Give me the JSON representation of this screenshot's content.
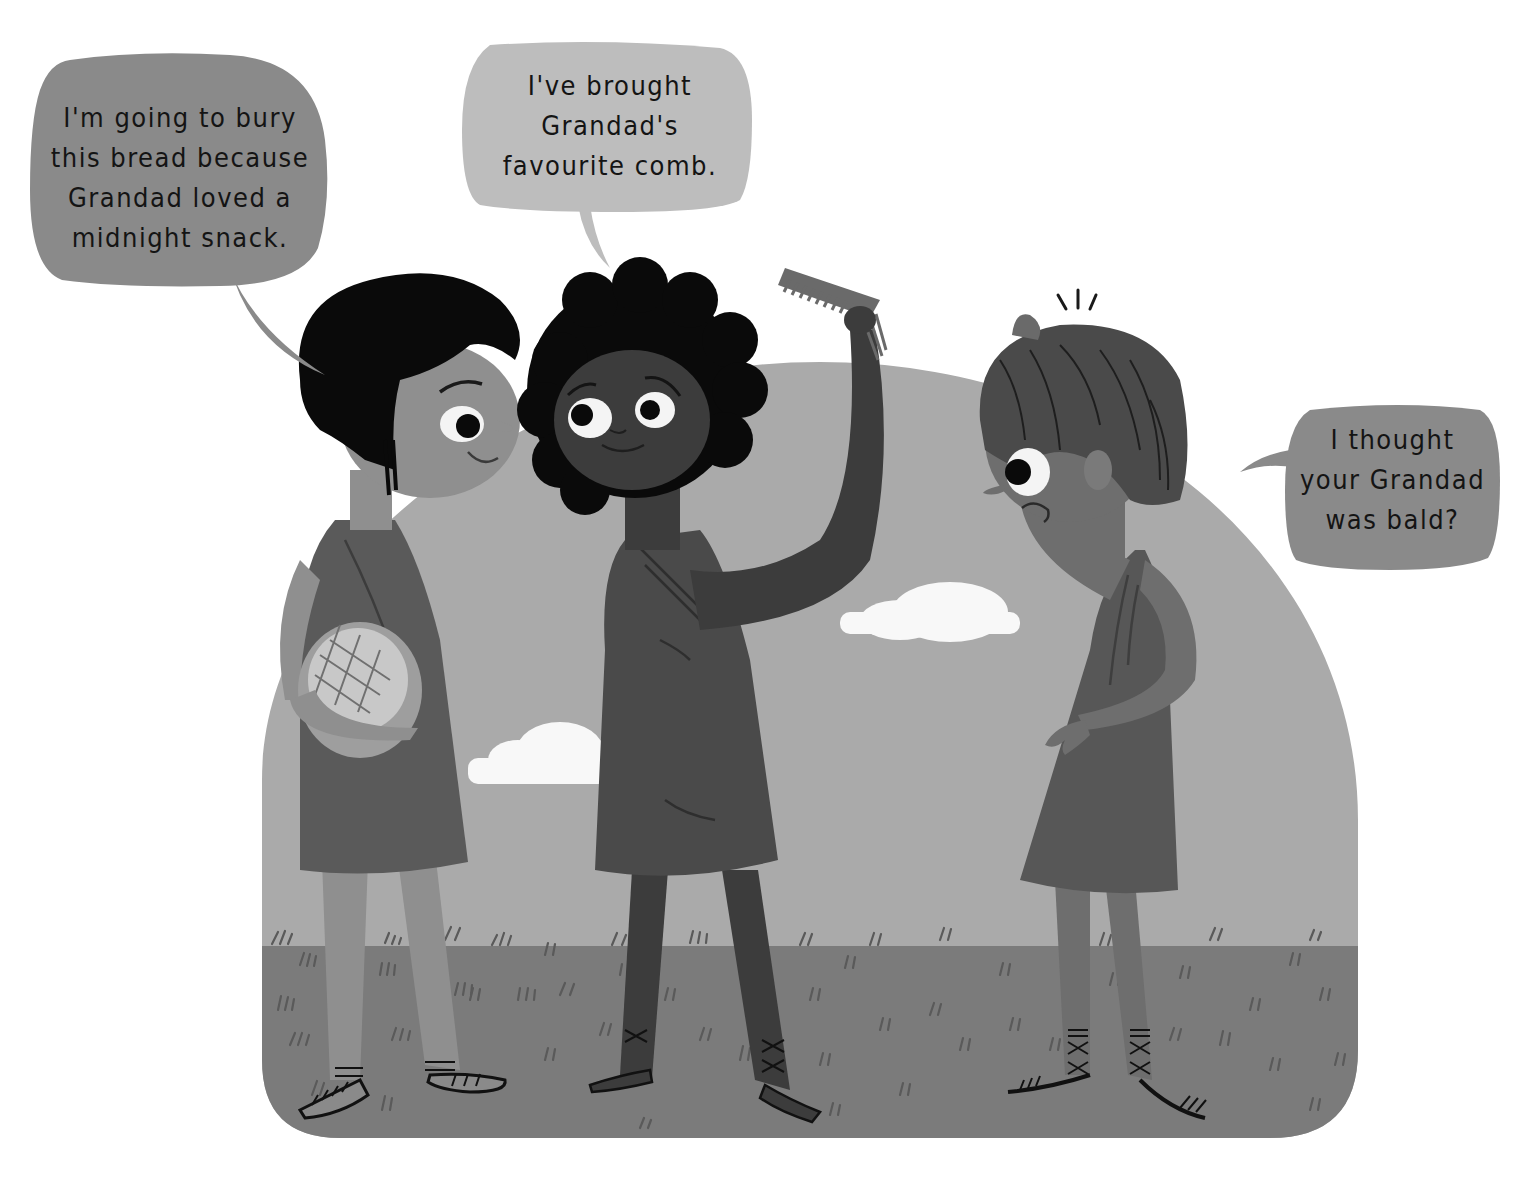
{
  "illustration": {
    "style": "grayscale children's book illustration",
    "colors": {
      "background": "#ffffff",
      "sky_arch": "#a9a9a9",
      "grass": "#7a7a7a",
      "cloud": "#f8f8f8",
      "bubble_dark": "#8a8a8a",
      "bubble_light": "#bdbdbd",
      "hair_black": "#0a0a0a",
      "skin_light": "#8c8c8c",
      "skin_dark": "#3c3c3c",
      "skin_mid": "#6e6e6e",
      "tunic_dark": "#4a4a4a",
      "tunic_mid": "#555555"
    }
  },
  "speech_bubbles": [
    {
      "speaker": "left-child",
      "lines": [
        "I'm going to bury",
        "this bread because",
        "Grandad loved a",
        "midnight snack."
      ]
    },
    {
      "speaker": "middle-child",
      "lines": [
        "I've brought",
        "Grandad's",
        "favourite comb."
      ]
    },
    {
      "speaker": "right-child",
      "lines": [
        "I thought",
        "your Grandad",
        "was bald?"
      ]
    }
  ],
  "characters": [
    {
      "name": "left-child",
      "holding": "bread-loaf",
      "expression": "smiling"
    },
    {
      "name": "middle-child",
      "holding": "comb",
      "expression": "smiling"
    },
    {
      "name": "right-child",
      "holding": "none",
      "expression": "puzzled"
    }
  ]
}
